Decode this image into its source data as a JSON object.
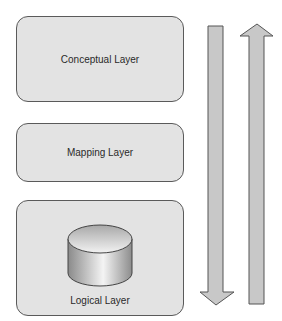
{
  "diagram": {
    "layers": [
      {
        "label": "Conceptual Layer"
      },
      {
        "label": "Mapping Layer"
      },
      {
        "label": "Logical Layer",
        "icon": "database-cylinder-icon"
      }
    ],
    "arrows": [
      {
        "direction": "down",
        "label": ""
      },
      {
        "direction": "up",
        "label": ""
      }
    ],
    "colors": {
      "box_fill": "#e3e3e3",
      "box_border": "#5a5a5a",
      "arrow_fill": "#c8c8c8",
      "arrow_border": "#555555"
    }
  }
}
